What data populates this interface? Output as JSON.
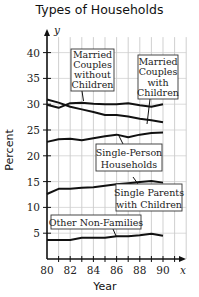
{
  "chart_data": {
    "type": "line",
    "title": "Types of Households",
    "xlabel": "Year",
    "ylabel": "Percent",
    "x_axis_symbol": "x",
    "y_axis_symbol": "y",
    "x": [
      80,
      81,
      82,
      83,
      84,
      85,
      86,
      87,
      88,
      89,
      90
    ],
    "x_ticks": [
      "80",
      "82",
      "84",
      "86",
      "88",
      "90"
    ],
    "y_ticks": [
      "5",
      "10",
      "15",
      "20",
      "25",
      "30",
      "35",
      "40"
    ],
    "xlim": [
      80,
      92
    ],
    "ylim": [
      0,
      44
    ],
    "grid": true,
    "series": [
      {
        "name": "Married Couples without Children",
        "values": [
          29.9,
          29.3,
          30.2,
          30.3,
          30.1,
          30.0,
          30.0,
          30.2,
          29.8,
          29.5,
          30.0
        ]
      },
      {
        "name": "Married Couples with Children",
        "values": [
          30.9,
          30.3,
          29.5,
          29.0,
          28.5,
          27.9,
          27.9,
          27.6,
          27.2,
          26.9,
          26.5
        ]
      },
      {
        "name": "Single-Person Households",
        "values": [
          22.7,
          23.2,
          23.3,
          23.0,
          23.4,
          23.8,
          24.1,
          23.6,
          24.1,
          24.4,
          24.5
        ]
      },
      {
        "name": "Single Parents with Children",
        "values": [
          12.6,
          13.6,
          13.6,
          13.8,
          13.9,
          14.2,
          14.5,
          14.7,
          14.9,
          15.1,
          14.8
        ]
      },
      {
        "name": "Other Non-Families",
        "values": [
          3.7,
          3.7,
          3.7,
          4.1,
          4.1,
          4.1,
          4.4,
          4.4,
          4.6,
          4.9,
          4.5
        ]
      }
    ],
    "annotations": [
      {
        "text": [
          "Married",
          "Couples",
          "without",
          "Children"
        ]
      },
      {
        "text": [
          "Married",
          "Couples",
          "with",
          "Children"
        ]
      },
      {
        "text": [
          "Single-Person",
          "Households"
        ]
      },
      {
        "text": [
          "Single Parents",
          "with Children"
        ]
      },
      {
        "text": [
          "Other Non-Families"
        ]
      }
    ]
  }
}
